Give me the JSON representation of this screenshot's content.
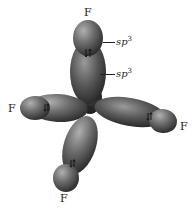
{
  "diagram": {
    "type": "orbital-overlap",
    "central_atom": "B",
    "ligands": [
      {
        "label": "F",
        "position": "top"
      },
      {
        "label": "F",
        "position": "left"
      },
      {
        "label": "F",
        "position": "right"
      },
      {
        "label": "F",
        "position": "bottom"
      }
    ],
    "hybrid_labels": [
      {
        "base": "sp",
        "exp": "3",
        "target": "F orbital (top outer lobe)"
      },
      {
        "base": "sp",
        "exp": "3",
        "target": "B orbital (top inner lobe)"
      }
    ],
    "electron_pair_symbol": "⇅",
    "colors": {
      "lobe_dark": "#2e2e2e",
      "lobe_mid": "#6a6a6a",
      "lobe_light": "#a8a8a8",
      "text": "#222222",
      "background": "#ffffff"
    }
  }
}
